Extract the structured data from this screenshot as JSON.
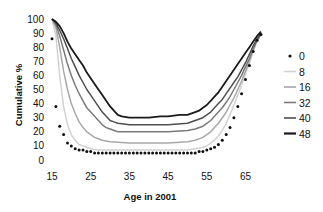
{
  "chart_data": {
    "type": "line",
    "title": "",
    "xlabel": "Age in 2001",
    "ylabel": "Cumulative %",
    "xlim": [
      15,
      70
    ],
    "ylim": [
      0,
      100
    ],
    "x_ticks": [
      15,
      25,
      35,
      45,
      55,
      65
    ],
    "y_ticks": [
      0,
      10,
      20,
      30,
      40,
      50,
      60,
      70,
      80,
      90,
      100
    ],
    "grid": false,
    "legend_position": "right",
    "series": [
      {
        "name": "0",
        "style": "dots",
        "color": "#111111",
        "x": [
          15,
          16,
          17,
          18,
          19,
          20,
          21,
          22,
          23,
          24,
          25,
          26,
          27,
          28,
          29,
          30,
          31,
          32,
          33,
          34,
          35,
          36,
          37,
          38,
          39,
          40,
          41,
          42,
          43,
          44,
          45,
          46,
          47,
          48,
          49,
          50,
          51,
          52,
          53,
          54,
          55,
          56,
          57,
          58,
          59,
          60,
          61,
          62,
          63,
          64,
          65,
          66,
          67,
          68,
          69
        ],
        "y": [
          86,
          38,
          24,
          18,
          12,
          10,
          8,
          7,
          7,
          6,
          6,
          5,
          5,
          5,
          5,
          5,
          5,
          5,
          5,
          5,
          5,
          5,
          5,
          5,
          5,
          5,
          5,
          5,
          5,
          5,
          5,
          5,
          5,
          5,
          5,
          5,
          5,
          5,
          6,
          6,
          7,
          8,
          9,
          11,
          14,
          18,
          23,
          30,
          38,
          47,
          57,
          67,
          77,
          85,
          89
        ]
      },
      {
        "name": "8",
        "style": "line",
        "color": "#d2d2d2",
        "x": [
          15,
          16,
          17,
          18,
          19,
          20,
          21,
          22,
          23,
          24,
          25,
          27,
          30,
          35,
          40,
          45,
          50,
          52,
          54,
          55,
          56,
          57,
          58,
          59,
          60,
          61,
          62,
          63,
          64,
          65,
          66,
          67,
          68,
          69
        ],
        "y": [
          100,
          88,
          60,
          38,
          25,
          18,
          14,
          11,
          10,
          9,
          8,
          7,
          7,
          7,
          7,
          7,
          7,
          8,
          9,
          10,
          12,
          14,
          17,
          21,
          26,
          32,
          39,
          46,
          53,
          61,
          69,
          77,
          84,
          89
        ]
      },
      {
        "name": "16",
        "style": "line",
        "color": "#a8a8a8",
        "x": [
          15,
          16,
          17,
          18,
          19,
          20,
          21,
          22,
          23,
          24,
          25,
          26,
          27,
          28,
          30,
          35,
          40,
          45,
          50,
          52,
          54,
          55,
          56,
          57,
          58,
          59,
          60,
          61,
          62,
          63,
          64,
          65,
          66,
          67,
          68,
          69
        ],
        "y": [
          100,
          94,
          80,
          63,
          50,
          40,
          33,
          27,
          23,
          20,
          18,
          16,
          15,
          14,
          13,
          12,
          12,
          12,
          13,
          14,
          16,
          18,
          20,
          23,
          26,
          30,
          34,
          39,
          44,
          50,
          56,
          63,
          70,
          78,
          85,
          89
        ]
      },
      {
        "name": "32",
        "style": "line",
        "color": "#7a7a7a",
        "x": [
          15,
          16,
          17,
          18,
          19,
          20,
          21,
          22,
          23,
          24,
          25,
          26,
          27,
          28,
          29,
          30,
          32,
          35,
          40,
          45,
          50,
          52,
          54,
          55,
          56,
          57,
          58,
          59,
          60,
          61,
          62,
          63,
          64,
          65,
          66,
          67,
          68,
          69
        ],
        "y": [
          100,
          96,
          88,
          78,
          68,
          60,
          53,
          47,
          42,
          37,
          34,
          31,
          28,
          25,
          23,
          22,
          20,
          20,
          20,
          20,
          21,
          22,
          24,
          26,
          28,
          31,
          34,
          37,
          41,
          45,
          50,
          55,
          60,
          66,
          72,
          79,
          85,
          89
        ]
      },
      {
        "name": "40",
        "style": "line",
        "color": "#4e4e4e",
        "x": [
          15,
          16,
          17,
          18,
          19,
          20,
          21,
          22,
          23,
          24,
          25,
          26,
          27,
          28,
          29,
          30,
          31,
          32,
          35,
          40,
          45,
          50,
          52,
          54,
          55,
          56,
          57,
          58,
          59,
          60,
          61,
          62,
          63,
          64,
          65,
          66,
          67,
          68,
          69
        ],
        "y": [
          100,
          97,
          92,
          86,
          79,
          72,
          66,
          60,
          55,
          50,
          46,
          42,
          38,
          34,
          31,
          28,
          27,
          26,
          25,
          25,
          25,
          26,
          28,
          30,
          32,
          34,
          37,
          40,
          43,
          47,
          51,
          55,
          59,
          64,
          69,
          75,
          81,
          86,
          90
        ]
      },
      {
        "name": "48",
        "style": "line",
        "color": "#1a1a1a",
        "x": [
          15,
          16,
          17,
          18,
          19,
          20,
          21,
          22,
          23,
          24,
          25,
          26,
          27,
          28,
          29,
          30,
          31,
          32,
          33,
          35,
          37,
          40,
          43,
          45,
          48,
          50,
          52,
          53,
          54,
          55,
          56,
          57,
          58,
          59,
          60,
          61,
          62,
          63,
          64,
          65,
          66,
          67,
          68,
          69
        ],
        "y": [
          100,
          98,
          95,
          90,
          84,
          79,
          75,
          71,
          67,
          62,
          58,
          54,
          50,
          46,
          42,
          38,
          35,
          32,
          31,
          30,
          30,
          30,
          31,
          31,
          32,
          32,
          34,
          35,
          37,
          39,
          42,
          45,
          48,
          52,
          56,
          60,
          64,
          68,
          72,
          76,
          80,
          84,
          88,
          91
        ]
      }
    ]
  }
}
